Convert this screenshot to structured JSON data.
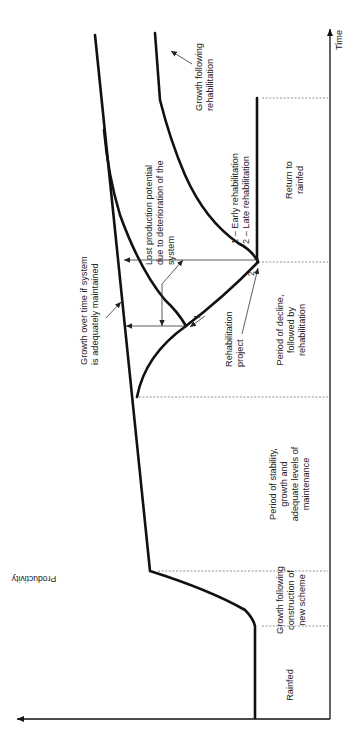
{
  "axes": {
    "x_label": "Time",
    "y_label": "Productivity"
  },
  "phases": [
    {
      "id": "rainfed",
      "lines": [
        "Rainfed"
      ]
    },
    {
      "id": "growth-construction",
      "lines": [
        "Growth following",
        "construction of",
        "new scheme"
      ]
    },
    {
      "id": "stability",
      "lines": [
        "Period of stability,",
        "growth and",
        "adequate levels of",
        "maintenance"
      ]
    },
    {
      "id": "decline",
      "lines": [
        "Period of decline,",
        "followed by",
        "rehabilitation"
      ]
    },
    {
      "id": "return-rainfed",
      "lines": [
        "Return to",
        "rainfed"
      ]
    }
  ],
  "annotations": {
    "maintained_growth": [
      "Growth over time if system",
      "is adequately maintained"
    ],
    "lost_production": [
      "Lost production potential",
      "due to deterioration of the",
      "system"
    ],
    "growth_rehab": [
      "Growth following",
      "rehabilitation"
    ],
    "rehab_project": [
      "Rehabilitation",
      "project"
    ],
    "legend": [
      "1 – Early rehabilitation",
      "2 – Late rehabilitation"
    ],
    "point1": "1",
    "point2": "2"
  }
}
